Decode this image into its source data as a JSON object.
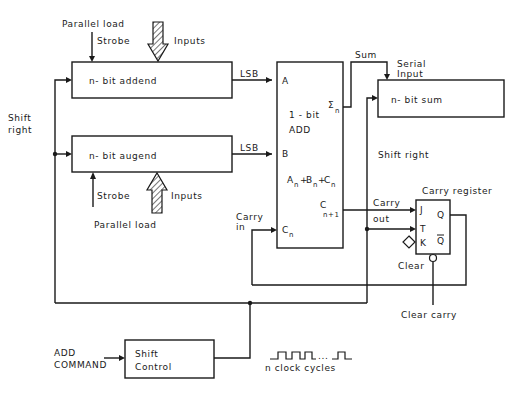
{
  "addend_register": {
    "label": "n- bit  addend",
    "top_labels": {
      "parallel_load": "Parallel load",
      "strobe": "Strobe",
      "inputs": "Inputs"
    },
    "output": "LSB"
  },
  "augend_register": {
    "label": "n- bit  augend",
    "bottom_labels": {
      "parallel_load": "Parallel load",
      "strobe": "Strobe",
      "inputs": "Inputs"
    },
    "output": "LSB"
  },
  "shift_right_left": "Shift right",
  "shift_right_left_line1": "Shift",
  "shift_right_left_line2": "right",
  "adder": {
    "line1": "1 - bit",
    "line2": "ADD",
    "pin_a": "A",
    "pin_b": "B",
    "pin_cn": "C",
    "pin_cn_sub": "n",
    "sum_out": "Σ",
    "sum_out_sub": "n",
    "carry_out": "C",
    "carry_out_sub": "n+1",
    "equation": {
      "a": "A",
      "b": "B",
      "c": "C",
      "sub": "n"
    }
  },
  "sum_label": "Sum",
  "serial_input": {
    "line1": "Serial",
    "line2": "Input"
  },
  "sum_register": {
    "label": "n- bit  sum"
  },
  "shift_right_mid": "Shift  right",
  "carry_in": {
    "line1": "Carry",
    "line2": "in"
  },
  "carry_out_label": {
    "line1": "Carry",
    "line2": "out"
  },
  "carry_register": {
    "title": "Carry  register",
    "pin_j": "J",
    "pin_t": "T",
    "pin_k": "K",
    "pin_q": "Q",
    "pin_qbar": "Q",
    "clear": "Clear"
  },
  "clear_carry": "Clear  carry",
  "shift_control": {
    "line1": "Shift",
    "line2": "Control"
  },
  "add_command": {
    "line1": "ADD",
    "line2": "COMMAND"
  },
  "clock_label": "n  clock  cycles",
  "clock_dots": "..."
}
